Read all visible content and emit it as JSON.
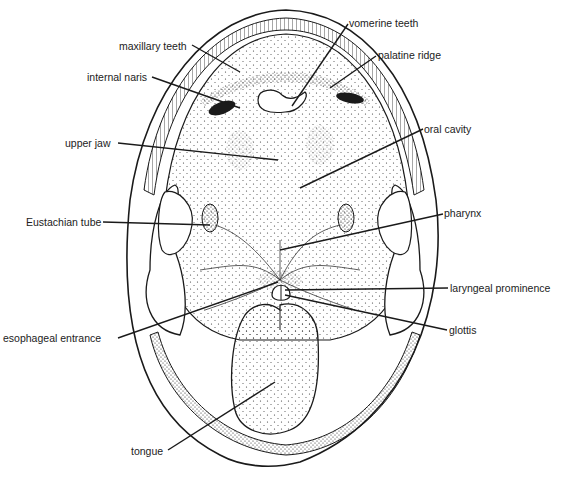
{
  "diagram": {
    "labels": [
      {
        "id": "maxillary-teeth",
        "text": "maxillary teeth"
      },
      {
        "id": "vomerine-teeth",
        "text": "vomerine teeth"
      },
      {
        "id": "internal-naris",
        "text": "internal naris"
      },
      {
        "id": "palatine-ridge",
        "text": "palatine ridge"
      },
      {
        "id": "upper-jaw",
        "text": "upper jaw"
      },
      {
        "id": "oral-cavity",
        "text": "oral cavity"
      },
      {
        "id": "eustachian-tube",
        "text": "Eustachian tube"
      },
      {
        "id": "pharynx",
        "text": "pharynx"
      },
      {
        "id": "laryngeal-prominence",
        "text": "laryngeal prominence"
      },
      {
        "id": "esophageal-entrance",
        "text": "esophageal entrance"
      },
      {
        "id": "glottis",
        "text": "glottis"
      },
      {
        "id": "tongue",
        "text": "tongue"
      }
    ],
    "colors": {
      "ink": "#1a1a1a",
      "paper": "#ffffff",
      "stipple": "#3a3a3a"
    }
  }
}
